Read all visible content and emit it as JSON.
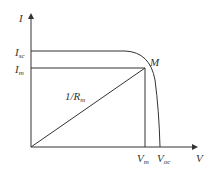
{
  "diagram": {
    "axes": {
      "y_label": "I",
      "x_label": "V"
    },
    "labels": {
      "isc": {
        "main": "I",
        "sub": "sc"
      },
      "im": {
        "main": "I",
        "sub": "m"
      },
      "vm": {
        "main": "V",
        "sub": "m"
      },
      "voc": {
        "main": "V",
        "sub": "oc"
      },
      "point": "M",
      "slope": {
        "main": "1/R",
        "sub": "m"
      }
    },
    "colors": {
      "line": "#333333"
    }
  }
}
